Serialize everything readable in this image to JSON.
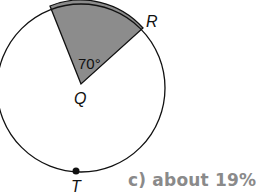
{
  "diagram": {
    "type": "circle-sector",
    "center_label": "Q",
    "point_labels": {
      "R": "R",
      "T": "T"
    },
    "central_angle_label": "70°",
    "central_angle_degrees": 70,
    "colors": {
      "stroke": "#111111",
      "sector_fill": "#8c8c8c",
      "answer_text": "#8a8a8a"
    }
  },
  "answer": {
    "text": "c) about 19%"
  }
}
